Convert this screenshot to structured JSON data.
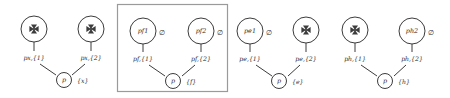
{
  "figure": {
    "type": "graph-diagram",
    "colors": {
      "stroke": "#3c3c3c",
      "box_stroke": "#9a9a9a",
      "background": "#ffffff",
      "glyph": "#3c3c3c"
    },
    "highlight_box": {
      "x": 117,
      "y": 4,
      "width": 111,
      "height": 88
    },
    "groups": [
      {
        "id": "group-px",
        "boxed": false,
        "left_node": {
          "label": "",
          "glyph": "pinwheel-icon",
          "annotation": ""
        },
        "right_node": {
          "label": "",
          "glyph": "pinwheel-icon",
          "annotation": ""
        },
        "left_edge_label": "px,{1}",
        "right_edge_label": "px,{2}",
        "root_label": "p",
        "root_set": "{x}"
      },
      {
        "id": "group-pf",
        "boxed": true,
        "left_node": {
          "label": "pf1",
          "glyph": "none",
          "annotation": "∅"
        },
        "right_node": {
          "label": "pf2",
          "glyph": "none",
          "annotation": "∅"
        },
        "left_edge_label": "pf,{1}",
        "right_edge_label": "pf,{2}",
        "root_label": "p",
        "root_set": "{f}"
      },
      {
        "id": "group-pe",
        "boxed": false,
        "left_node": {
          "label": "pe1",
          "glyph": "none",
          "annotation": "∅"
        },
        "right_node": {
          "label": "",
          "glyph": "pinwheel-icon",
          "annotation": ""
        },
        "left_edge_label": "pe,{1}",
        "right_edge_label": "pe,{2}",
        "root_label": "p",
        "root_set": "{e}"
      },
      {
        "id": "group-ph",
        "boxed": false,
        "left_node": {
          "label": "",
          "glyph": "pinwheel-icon",
          "annotation": ""
        },
        "right_node": {
          "label": "ph2",
          "glyph": "none",
          "annotation": "∅"
        },
        "left_edge_label": "ph,{1}",
        "right_edge_label": "ph,{2}",
        "root_label": "p",
        "root_set": "{h}"
      }
    ]
  }
}
